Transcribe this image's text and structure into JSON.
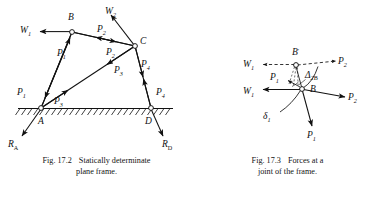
{
  "figures": [
    {
      "id": "fig-17-2",
      "caption_number": "Fig. 17.2",
      "caption_line1": "Statically determinate",
      "caption_line2": "plane frame.",
      "caption_full": "Fig. 17.2   Statically determinate plane frame.",
      "nodes": [
        {
          "name": "A",
          "label": "A",
          "x": 41,
          "y": 108
        },
        {
          "name": "B",
          "label": "B",
          "x": 72,
          "y": 32
        },
        {
          "name": "C",
          "label": "C",
          "x": 135,
          "y": 46
        },
        {
          "name": "D",
          "label": "D",
          "x": 151,
          "y": 108
        }
      ],
      "members": [
        {
          "name": "member-AB",
          "from": "A",
          "to": "B",
          "force_label": "P",
          "force_sub": "1"
        },
        {
          "name": "member-BC",
          "from": "B",
          "to": "C",
          "force_label": "P",
          "force_sub": "2"
        },
        {
          "name": "member-AC",
          "from": "A",
          "to": "C",
          "force_label": "P",
          "force_sub": "3"
        },
        {
          "name": "member-CD",
          "from": "C",
          "to": "D",
          "force_label": "P",
          "force_sub": "4"
        }
      ],
      "applied_loads": [
        {
          "name": "load-W1",
          "label": "W",
          "sub": "1",
          "at_node": "B",
          "direction": "left"
        },
        {
          "name": "load-W2",
          "label": "W",
          "sub": "2",
          "at_node": "C",
          "direction": "up-left"
        }
      ],
      "reactions": [
        {
          "name": "reaction-RA",
          "label": "R",
          "sub": "A",
          "at_node": "A",
          "direction": "down-left"
        },
        {
          "name": "reaction-RD",
          "label": "R",
          "sub": "D",
          "at_node": "D",
          "direction": "down-right"
        }
      ],
      "member_force_labels": [
        {
          "name": "force-P1-at-B",
          "label": "P",
          "sub": "1",
          "x": 62,
          "y": 53
        },
        {
          "name": "force-P1-at-A",
          "label": "P",
          "sub": "1",
          "x": 22,
          "y": 92
        },
        {
          "name": "force-P2-at-B",
          "label": "P",
          "sub": "2",
          "x": 100,
          "y": 32
        },
        {
          "name": "force-P2-at-C",
          "label": "P",
          "sub": "2",
          "x": 109,
          "y": 52
        },
        {
          "name": "force-P3-at-A",
          "label": "P",
          "sub": "3",
          "x": 57,
          "y": 101
        },
        {
          "name": "force-P3-at-C",
          "label": "P",
          "sub": "3",
          "x": 117,
          "y": 70
        },
        {
          "name": "force-P4-at-C",
          "label": "P",
          "sub": "4",
          "x": 143,
          "y": 64
        },
        {
          "name": "force-P4-at-D",
          "label": "P",
          "sub": "4",
          "x": 158,
          "y": 92
        }
      ],
      "ground": {
        "name": "ground-hatched-line",
        "y": 108,
        "x_start": 18,
        "x_end": 173
      }
    },
    {
      "id": "fig-17-3",
      "caption_number": "Fig. 17.3",
      "caption_line1": "Forces at a",
      "caption_line2": "joint of the frame.",
      "caption_full": "Fig. 17.3   Forces at a joint of the frame.",
      "nodes": [
        {
          "name": "joint-B",
          "label": "B",
          "x": 302,
          "y": 89
        },
        {
          "name": "joint-B-prime",
          "label": "B",
          "prime": "′",
          "x": 296,
          "y": 64
        }
      ],
      "forces": [
        {
          "name": "force-W1-displaced",
          "label": "W",
          "sub": "1",
          "style": "dashed",
          "direction": "left",
          "x": 248,
          "y": 64
        },
        {
          "name": "force-P2-displaced",
          "label": "P",
          "sub": "2",
          "style": "dashed",
          "direction": "right",
          "x": 341,
          "y": 62
        },
        {
          "name": "force-W1",
          "label": "W",
          "sub": "1",
          "style": "solid",
          "direction": "left",
          "x": 249,
          "y": 91
        },
        {
          "name": "force-P2",
          "label": "P",
          "sub": "2",
          "style": "solid",
          "direction": "right",
          "x": 356,
          "y": 97
        },
        {
          "name": "force-P1",
          "label": "P",
          "sub": "1",
          "style": "solid",
          "direction": "down",
          "x": 305,
          "y": 134
        },
        {
          "name": "force-P1-displaced",
          "label": "P",
          "sub": "1",
          "style": "solid",
          "direction": "down-left",
          "x": 273,
          "y": 77
        }
      ],
      "annotations": [
        {
          "name": "displacement-delta2B",
          "label": "Δ",
          "sub": "2",
          "suffix": "B",
          "x": 312,
          "y": 76
        },
        {
          "name": "deflection-delta1",
          "label": "δ",
          "sub": "1",
          "x": 268,
          "y": 116
        },
        {
          "name": "joint-B-label",
          "label": "B",
          "x": 314,
          "y": 88
        }
      ]
    }
  ],
  "colors": {
    "ink": "#111111",
    "background": "#ffffff"
  }
}
